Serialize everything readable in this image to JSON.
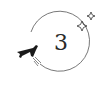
{
  "badge": {
    "number": "3",
    "icons": [
      "airplane-icon",
      "sparkle-icon",
      "sparkle-icon"
    ],
    "colors": {
      "stroke": "#555555",
      "plane": "#1a1a1a",
      "text": "#2a2a2a"
    }
  }
}
